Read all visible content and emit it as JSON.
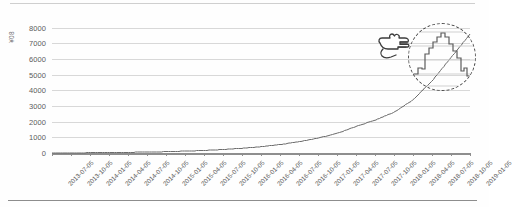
{
  "chart_data": {
    "type": "line",
    "title": "",
    "xlabel": "",
    "ylabel": "¥08",
    "ylim": [
      0,
      8500
    ],
    "grid": true,
    "legend": false,
    "yticks": [
      0,
      1000,
      2000,
      3000,
      4000,
      5000,
      6000,
      7000,
      8000
    ],
    "ytick_labels": [
      "0",
      "1000",
      "2000",
      "3000",
      "4000",
      "5000",
      "6000",
      "7000",
      "8000"
    ],
    "categories": [
      "2013-07-05",
      "2013-10-05",
      "2014-01-05",
      "2014-04-05",
      "2014-07-05",
      "2014-10-05",
      "2015-01-05",
      "2015-04-05",
      "2015-07-05",
      "2015-10-05",
      "2016-01-05",
      "2016-04-05",
      "2016-07-05",
      "2016-10-05",
      "2017-01-05",
      "2017-04-05",
      "2017-07-05",
      "2017-10-05",
      "2018-01-05",
      "2018-04-05",
      "2018-07-05",
      "2018-10-05",
      "2019-01-05"
    ],
    "series": [
      {
        "name": "cumulative",
        "values": [
          5,
          10,
          18,
          28,
          42,
          60,
          85,
          120,
          165,
          225,
          300,
          400,
          540,
          720,
          950,
          1250,
          1700,
          2100,
          2600,
          3400,
          4600,
          6100,
          7600
        ]
      }
    ],
    "annotations": {
      "pointer": "pointing-hand",
      "callout": "dashed-circle-zoom-on-final-segment",
      "callout_label": ""
    }
  },
  "axis": {
    "y_unit_label": "¥08"
  }
}
